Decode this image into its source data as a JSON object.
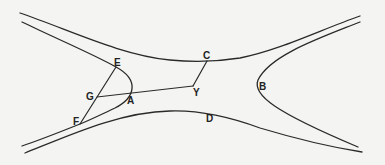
{
  "diagram": {
    "stroke_color": "#2a2a2a",
    "background": "#f4f4f2",
    "points": {
      "A": {
        "label": "A",
        "x": 130,
        "y": 94,
        "lx": 127,
        "ly": 104
      },
      "B": {
        "label": "B",
        "x": 257,
        "y": 86,
        "lx": 259,
        "ly": 90
      },
      "C": {
        "label": "C",
        "x": 207,
        "y": 61,
        "lx": 203,
        "ly": 59
      },
      "D": {
        "label": "D",
        "x": 210,
        "y": 118,
        "lx": 206,
        "ly": 122
      },
      "E": {
        "label": "E",
        "x": 116,
        "y": 67,
        "lx": 114,
        "ly": 66
      },
      "F": {
        "label": "F",
        "x": 80,
        "y": 124,
        "lx": 73,
        "ly": 125
      },
      "G": {
        "label": "G",
        "x": 97,
        "y": 97,
        "lx": 86,
        "ly": 100
      },
      "Y": {
        "label": "Y",
        "x": 193,
        "y": 86,
        "lx": 193,
        "ly": 96
      }
    },
    "curves": [
      {
        "name": "upper-outer-curve",
        "d": "M20,13 C70,30 120,55 170,60 C190,62 215,62 240,58 C280,50 320,30 360,16"
      },
      {
        "name": "left-hyperbola-branch",
        "d": "M22,22 C55,38 95,55 116,67 C140,80 135,98 115,108 C100,115 90,120 80,124 C60,132 40,140 22,146"
      },
      {
        "name": "lower-outer-curve",
        "d": "M25,153 C70,135 120,112 170,111 C200,110 230,117 260,128 C300,140 330,147 362,152"
      },
      {
        "name": "right-hyperbola-branch",
        "d": "M360,22 C320,38 270,55 258,80 C252,95 275,112 358,147"
      }
    ],
    "segments": [
      {
        "name": "segment-E-F",
        "from": "E",
        "to": "F"
      },
      {
        "name": "segment-G-Y",
        "from": "G",
        "to": "Y"
      },
      {
        "name": "segment-Y-C",
        "from": "Y",
        "to": "C"
      }
    ]
  }
}
